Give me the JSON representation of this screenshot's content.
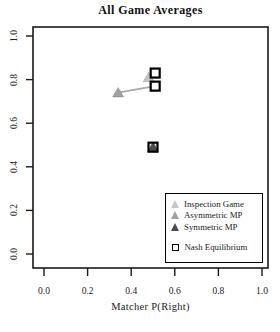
{
  "chart_data": {
    "type": "scatter",
    "title": "All Game Averages",
    "xlabel": "Matcher P(Right)",
    "ylabel": "",
    "xlim": [
      0.0,
      1.0
    ],
    "ylim": [
      0.0,
      1.0
    ],
    "grid": false,
    "x_ticks": {
      "values": [
        0.0,
        0.2,
        0.4,
        0.6,
        0.8,
        1.0
      ],
      "labels": [
        "0.0",
        "0.2",
        "0.4",
        "0.6",
        "0.8",
        "1.0"
      ]
    },
    "y_ticks": {
      "values": [
        0.0,
        0.2,
        0.4,
        0.6,
        0.8,
        1.0
      ],
      "labels": [
        "0.0",
        "0.2",
        "0.4",
        "0.6",
        "0.8",
        "1.0"
      ]
    },
    "series": [
      {
        "name": "Inspection Game",
        "marker": "triangle",
        "color": "#c6c6c6",
        "observed": {
          "x": 0.48,
          "y": 0.81
        },
        "nash": {
          "x": 0.51,
          "y": 0.83
        }
      },
      {
        "name": "Asymmetric MP",
        "marker": "triangle",
        "color": "#a2a2a2",
        "observed": {
          "x": 0.34,
          "y": 0.74
        },
        "nash": {
          "x": 0.51,
          "y": 0.77
        }
      },
      {
        "name": "Symmetric MP",
        "marker": "triangle",
        "color": "#4c4c4c",
        "observed": {
          "x": 0.5,
          "y": 0.49
        },
        "nash": {
          "x": 0.5,
          "y": 0.49
        }
      }
    ],
    "nash_marker": {
      "shape": "open-square",
      "stroke": "#000000",
      "fill": "none",
      "label": "Nash Equilibrium"
    },
    "connector_color": "#a8a8a8",
    "axis_color": "#1a1a1a",
    "legend": {
      "position": "lower-right",
      "nash_label": "Nash Equilibrium"
    }
  }
}
